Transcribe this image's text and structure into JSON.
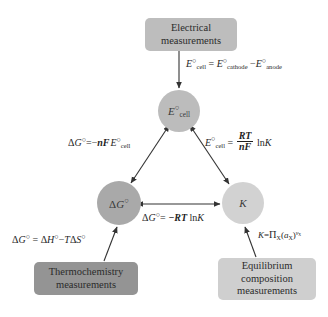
{
  "figure": {
    "clipped_caption": "· ·  · · ·· · ·· ·  ·· ··· ··  ··· · · ·· · ·· ·",
    "background_color": "#ffffff"
  },
  "boxes": {
    "electrical": {
      "lines": [
        "Electrical",
        "measurements"
      ],
      "color": "#bdbdbd"
    },
    "thermochemistry": {
      "lines": [
        "Thermochemistry",
        "measurements"
      ],
      "color": "#949494"
    },
    "equilibrium": {
      "lines": [
        "Equilibrium",
        "composition",
        "measurements"
      ],
      "color": "#cfcfcf"
    }
  },
  "circles": {
    "ecell": {
      "label": "E°cell",
      "color": "#bcbcbc"
    },
    "delta_g": {
      "label": "ΔG°",
      "color": "#a9a9a9"
    },
    "k": {
      "label": "K",
      "color": "#d2d2d2"
    }
  },
  "equations": {
    "cell_potential": "E°cell = E°cathode − E°anode",
    "gibbs_from_cell": "ΔG° = −nFE°cell",
    "cell_from_k": "E°cell = (RT/nF) lnK",
    "gibbs_from_k": "ΔG° = −RT lnK",
    "gibbs_from_enthalpy": "ΔG° = ΔH° − TΔS°",
    "k_definition": "K = ΠX (aX)^νX"
  },
  "arrows": {
    "color": "#333333",
    "connectors": [
      {
        "from": "electrical-box",
        "to": "ecell-circle",
        "style": "single-headed"
      },
      {
        "from": "ecell-circle",
        "to": "delta-g-circle",
        "style": "double-headed"
      },
      {
        "from": "ecell-circle",
        "to": "k-circle",
        "style": "double-headed"
      },
      {
        "from": "delta-g-circle",
        "to": "k-circle",
        "style": "double-headed"
      },
      {
        "from": "thermochemistry-box",
        "to": "delta-g-circle",
        "style": "single-headed"
      },
      {
        "from": "equilibrium-box",
        "to": "k-circle",
        "style": "single-headed"
      }
    ]
  }
}
